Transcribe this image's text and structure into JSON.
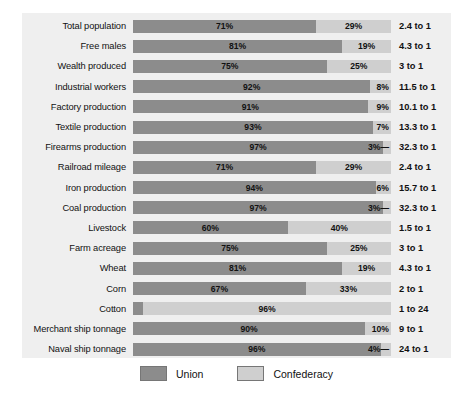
{
  "chart_data": {
    "type": "bar",
    "subtype": "stacked-horizontal-100pct",
    "title": "",
    "xlabel": "",
    "ylabel": "",
    "xlim": [
      0,
      100
    ],
    "grid": false,
    "legend_position": "bottom-center",
    "categories": [
      "Total population",
      "Free males",
      "Wealth produced",
      "Industrial workers",
      "Factory production",
      "Textile production",
      "Firearms production",
      "Railroad mileage",
      "Iron production",
      "Coal production",
      "Livestock",
      "Farm acreage",
      "Wheat",
      "Corn",
      "Cotton",
      "Merchant ship tonnage",
      "Naval ship tonnage"
    ],
    "series": [
      {
        "name": "Union",
        "color": "#8c8c8c",
        "values": [
          71,
          81,
          75,
          92,
          91,
          93,
          97,
          71,
          94,
          97,
          60,
          75,
          81,
          67,
          4,
          90,
          96
        ]
      },
      {
        "name": "Confederacy",
        "color": "#cfcfcf",
        "values": [
          29,
          19,
          25,
          8,
          9,
          7,
          3,
          29,
          6,
          3,
          40,
          25,
          19,
          33,
          96,
          10,
          4
        ]
      }
    ],
    "ratios": [
      "2.4 to 1",
      "4.3 to 1",
      "3 to 1",
      "11.5 to 1",
      "10.1 to 1",
      "13.3 to 1",
      "32.3 to 1",
      "2.4 to 1",
      "15.7 to 1",
      "32.3 to 1",
      "1.5 to 1",
      "3 to 1",
      "4.3 to 1",
      "2 to 1",
      "1 to 24",
      "9 to 1",
      "24 to 1"
    ],
    "union_labels": [
      "71%",
      "81%",
      "75%",
      "92%",
      "91%",
      "93%",
      "97%",
      "71%",
      "94%",
      "97%",
      "60%",
      "75%",
      "81%",
      "67%",
      "— 4%",
      "90%",
      "96%"
    ],
    "conf_labels": [
      "29%",
      "19%",
      "25%",
      "8%",
      "9%",
      "7%",
      "3%—",
      "29%",
      "6%",
      "3%—",
      "40%",
      "25%",
      "19%",
      "33%",
      "96%",
      "10%",
      "4%—"
    ]
  },
  "legend": {
    "items": [
      {
        "label": "Union",
        "color": "#8c8c8c"
      },
      {
        "label": "Confederacy",
        "color": "#cfcfcf"
      }
    ]
  },
  "colors": {
    "union": "#8c8c8c",
    "confederacy": "#cfcfcf",
    "panel_background": "#efefef",
    "page_background": "#ffffff",
    "text": "#111111"
  }
}
